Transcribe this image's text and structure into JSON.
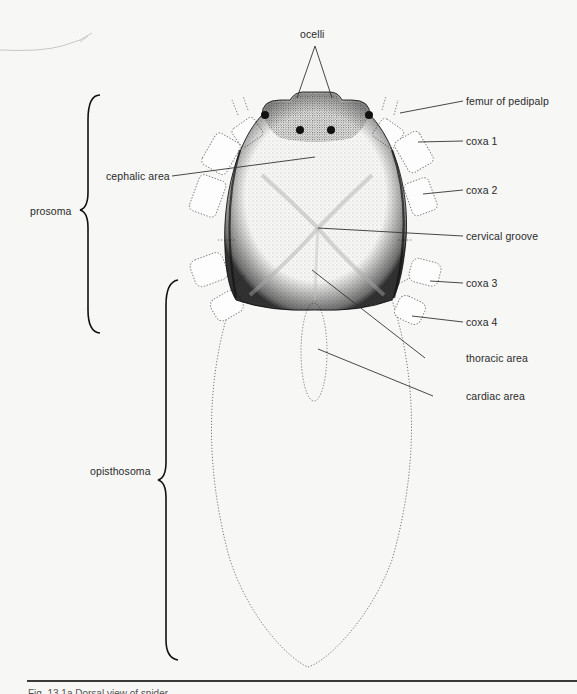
{
  "figure": {
    "colors": {
      "ink": "#2a2a2a",
      "background": "#f7f7f6",
      "stipple": "#555555"
    },
    "labels": {
      "ocelli": "ocelli",
      "femur_of_pedipalp": "femur of pedipalp",
      "cephalic_area": "cephalic area",
      "coxa_1": "coxa 1",
      "coxa_2": "coxa 2",
      "cervical_groove": "cervical groove",
      "coxa_3": "coxa 3",
      "coxa_4": "coxa 4",
      "thoracic_area": "thoracic area",
      "cardiac_area": "cardiac area",
      "prosoma": "prosoma",
      "opisthosoma": "opisthosoma"
    },
    "caption": "Fig. 13.1a  Dorsal view of spider"
  }
}
